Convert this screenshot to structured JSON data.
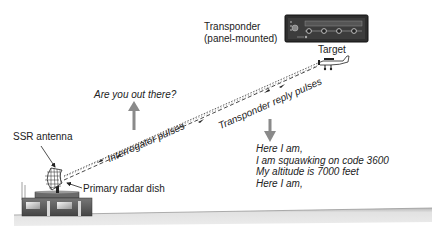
{
  "labels": {
    "transponder_line1": "Transponder",
    "transponder_line2": "(panel-mounted)",
    "target": "Target",
    "ssr_antenna": "SSR antenna",
    "primary_radar_dish": "Primary radar dish",
    "interrogator_pulses": "Interrogator pulses",
    "transponder_reply_pulses": "Transponder reply pulses",
    "query": "Are you out there?"
  },
  "reply_message": [
    "Here I am,",
    "I am squawking on code 3600",
    "My altitude is 7000 feet",
    "Here I am,"
  ],
  "transponder_panel": {
    "digits": [
      "3",
      "3",
      "3",
      "3"
    ],
    "mode_label": "OFF"
  },
  "colors": {
    "ink": "#222222",
    "arrow_gray": "#8a8a8a",
    "ground": "#d9d9d9",
    "building": "#5a5a5a",
    "panel_bg": "#3a3a3a"
  }
}
